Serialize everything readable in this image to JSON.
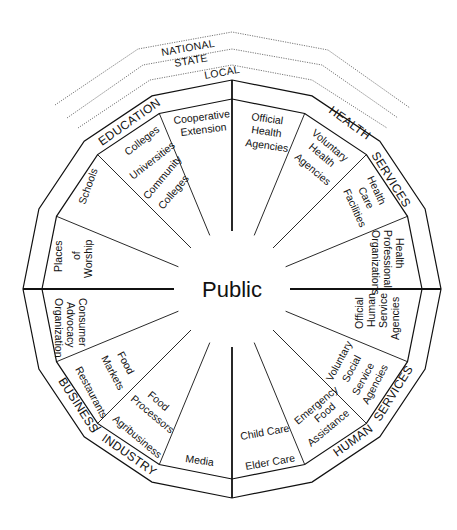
{
  "diagram": {
    "center_label": "Public",
    "levels": [
      "LOCAL",
      "STATE",
      "NATIONAL"
    ],
    "sectors": [
      {
        "name": "EDUCATION",
        "label_words": [
          "EDUCATION"
        ]
      },
      {
        "name": "HEALTH SERVICES",
        "label_words": [
          "HEALTH",
          "SERVICES"
        ]
      },
      {
        "name": "HUMAN SERVICES",
        "label_words": [
          "HUMAN",
          "SERVICES"
        ]
      },
      {
        "name": "BUSINESS / INDUSTRY",
        "label_words": [
          "BUSINESS",
          "/",
          "INDUSTRY"
        ]
      }
    ],
    "segments": {
      "cooperative_extension": [
        "Cooperative",
        "Extension"
      ],
      "colleges_universities": [
        "Colleges",
        "Universities",
        "Community",
        "Colleges"
      ],
      "schools": [
        "Schools"
      ],
      "places_of_worship": [
        "Places",
        "of",
        "Worship"
      ],
      "official_health": [
        "Official",
        "Health",
        "Agencies"
      ],
      "voluntary_health": [
        "Voluntary",
        "Health",
        "Agencies"
      ],
      "health_care_facilities": [
        "Health",
        "Care",
        "Facilities"
      ],
      "health_professional": [
        "Health",
        "Professional",
        "Organizations"
      ],
      "official_human_service": [
        "Official",
        "Human",
        "Service",
        "Agencies"
      ],
      "voluntary_social_service": [
        "Voluntary",
        "Social",
        "Service",
        "Agencies"
      ],
      "emergency_food": [
        "Emergency",
        "Food",
        "Assistance"
      ],
      "child_elder_care": [
        "Child Care",
        "Elder Care"
      ],
      "media": [
        "Media"
      ],
      "food_processors": [
        "Food",
        "Processors",
        "Agribusiness"
      ],
      "food_markets": [
        "Food",
        "Markets",
        "Restaurants"
      ],
      "consumer_advocacy": [
        "Consumer",
        "Advocacy",
        "Organization"
      ]
    },
    "colors": {
      "line": "#111111",
      "dotted": "#555555",
      "background": "#ffffff"
    }
  }
}
